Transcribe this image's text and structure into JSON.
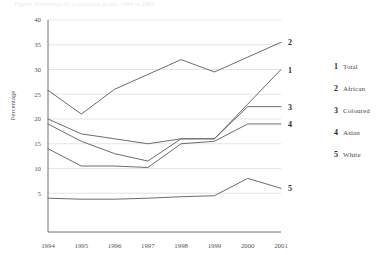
{
  "caption": {
    "text": "Figure: Percentage by population group, 1994 to 2001"
  },
  "chart_data": {
    "type": "line",
    "title": "",
    "xlabel": "",
    "ylabel": "Percentage",
    "x": [
      "1994",
      "1995",
      "1996",
      "1997",
      "1998",
      "1999",
      "2000",
      "2001"
    ],
    "xlim": [
      1994,
      2001
    ],
    "ylim": [
      0,
      40
    ],
    "yticks": [
      "5",
      "10",
      "15",
      "20",
      "25",
      "30",
      "35",
      "40"
    ],
    "ytick_values": [
      5,
      10,
      15,
      20,
      25,
      30,
      35,
      40
    ],
    "grid": "horizontal",
    "legend_position": "right",
    "series": [
      {
        "key": "1",
        "name": "Total",
        "endpoint_label": "1",
        "values": [
          20,
          17,
          16,
          15,
          16,
          16,
          23,
          30
        ]
      },
      {
        "key": "2",
        "name": "African",
        "endpoint_label": "2",
        "values": [
          25.8,
          21,
          26,
          29,
          32,
          29.5,
          32.5,
          35.5
        ]
      },
      {
        "key": "3",
        "name": "Coloured",
        "endpoint_label": "3",
        "values": [
          19,
          15.5,
          13,
          11.5,
          16,
          16,
          22.5,
          22.5
        ]
      },
      {
        "key": "4",
        "name": "Asian",
        "endpoint_label": "4",
        "values": [
          14,
          10.5,
          10.5,
          10.2,
          15,
          15.5,
          19,
          19
        ]
      },
      {
        "key": "5",
        "name": "White",
        "endpoint_label": "5",
        "values": [
          4,
          3.8,
          3.8,
          4,
          4.3,
          4.5,
          8,
          6
        ]
      }
    ]
  },
  "legend": {
    "items": [
      {
        "num": "1",
        "label": "Total"
      },
      {
        "num": "2",
        "label": "African"
      },
      {
        "num": "3",
        "label": "Coloured"
      },
      {
        "num": "4",
        "label": "Asian"
      },
      {
        "num": "5",
        "label": "White"
      }
    ]
  },
  "colors": {
    "line": "#6b6b72",
    "grid": "#d3d3d8",
    "axis": "#6e6e73",
    "text": "#4a4a4a"
  }
}
